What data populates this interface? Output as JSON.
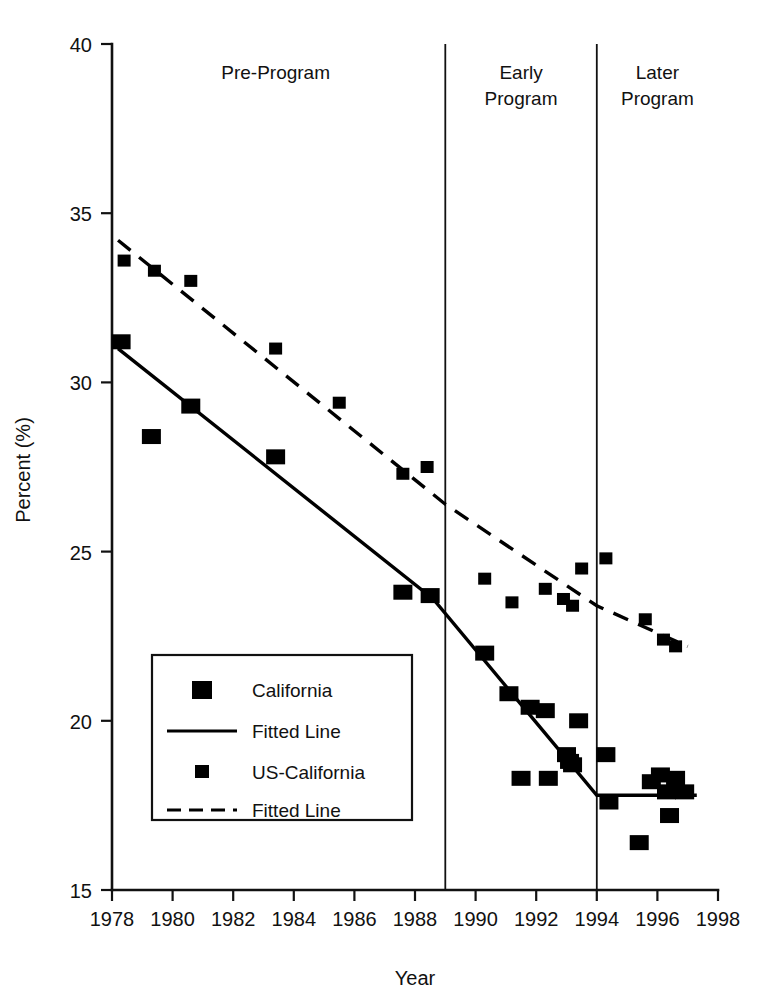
{
  "chart_data": {
    "type": "scatter",
    "title": "",
    "xlabel": "Year",
    "ylabel": "Percent (%)",
    "xlim": [
      1978,
      1998
    ],
    "ylim": [
      15,
      40
    ],
    "xticks": [
      1978,
      1980,
      1982,
      1984,
      1986,
      1988,
      1990,
      1992,
      1994,
      1996,
      1998
    ],
    "yticks": [
      15,
      20,
      25,
      30,
      35,
      40
    ],
    "grid": false,
    "legend_position": "inner-left-lower",
    "annotations": [
      {
        "text": "Pre-Program",
        "x": 1983.4,
        "y": 39.2
      },
      {
        "text": "Early\nProgram",
        "x": 1991.5,
        "y": 39.2
      },
      {
        "text": "Later\nProgram",
        "x": 1996.0,
        "y": 39.2
      }
    ],
    "vertical_dividers": [
      1989.0,
      1994.0
    ],
    "series": [
      {
        "name": "California",
        "marker": "square-large",
        "points": [
          {
            "x": 1978.3,
            "y": 31.2
          },
          {
            "x": 1979.3,
            "y": 28.4
          },
          {
            "x": 1980.6,
            "y": 29.3
          },
          {
            "x": 1983.4,
            "y": 27.8
          },
          {
            "x": 1987.6,
            "y": 23.8
          },
          {
            "x": 1988.5,
            "y": 23.7
          },
          {
            "x": 1990.3,
            "y": 22.0
          },
          {
            "x": 1991.1,
            "y": 20.8
          },
          {
            "x": 1991.5,
            "y": 18.3
          },
          {
            "x": 1991.8,
            "y": 20.4
          },
          {
            "x": 1992.3,
            "y": 20.3
          },
          {
            "x": 1992.4,
            "y": 18.3
          },
          {
            "x": 1993.0,
            "y": 19.0
          },
          {
            "x": 1993.1,
            "y": 18.8
          },
          {
            "x": 1993.2,
            "y": 18.7
          },
          {
            "x": 1993.4,
            "y": 20.0
          },
          {
            "x": 1994.3,
            "y": 19.0
          },
          {
            "x": 1994.4,
            "y": 17.6
          },
          {
            "x": 1995.4,
            "y": 16.4
          },
          {
            "x": 1995.8,
            "y": 18.2
          },
          {
            "x": 1996.1,
            "y": 18.4
          },
          {
            "x": 1996.3,
            "y": 17.9
          },
          {
            "x": 1996.4,
            "y": 17.2
          },
          {
            "x": 1996.6,
            "y": 18.3
          },
          {
            "x": 1996.9,
            "y": 17.9
          }
        ]
      },
      {
        "name": "US-California",
        "marker": "square-small",
        "points": [
          {
            "x": 1978.4,
            "y": 33.6
          },
          {
            "x": 1979.4,
            "y": 33.3
          },
          {
            "x": 1980.6,
            "y": 33.0
          },
          {
            "x": 1983.4,
            "y": 31.0
          },
          {
            "x": 1985.5,
            "y": 29.4
          },
          {
            "x": 1987.6,
            "y": 27.3
          },
          {
            "x": 1988.4,
            "y": 27.5
          },
          {
            "x": 1990.3,
            "y": 24.2
          },
          {
            "x": 1991.2,
            "y": 23.5
          },
          {
            "x": 1992.3,
            "y": 23.9
          },
          {
            "x": 1992.9,
            "y": 23.6
          },
          {
            "x": 1993.2,
            "y": 23.4
          },
          {
            "x": 1993.5,
            "y": 24.5
          },
          {
            "x": 1994.3,
            "y": 24.8
          },
          {
            "x": 1995.6,
            "y": 23.0
          },
          {
            "x": 1996.2,
            "y": 22.4
          },
          {
            "x": 1996.6,
            "y": 22.2
          }
        ]
      }
    ],
    "fits": [
      {
        "name": "California Fitted Line",
        "style": "solid",
        "vertices": [
          {
            "x": 1978.2,
            "y": 31.0
          },
          {
            "x": 1988.6,
            "y": 23.6
          },
          {
            "x": 1994.0,
            "y": 17.8
          },
          {
            "x": 1997.3,
            "y": 17.8
          }
        ]
      },
      {
        "name": "US-California Fitted Line",
        "style": "dashed",
        "vertices": [
          {
            "x": 1978.2,
            "y": 34.2
          },
          {
            "x": 1989.0,
            "y": 26.4
          },
          {
            "x": 1994.0,
            "y": 23.4
          },
          {
            "x": 1997.0,
            "y": 22.2
          }
        ]
      }
    ]
  },
  "axes": {
    "y_title": "Percent (%)",
    "x_title": "Year",
    "x_tick_labels": [
      "1978",
      "1980",
      "1982",
      "1984",
      "1986",
      "1988",
      "1990",
      "1992",
      "1994",
      "1996",
      "1998"
    ],
    "y_tick_labels": [
      "40",
      "35",
      "30",
      "25",
      "20",
      "15"
    ]
  },
  "regions": [
    {
      "id": "pre-program",
      "label": "Pre-Program",
      "lines": [
        "Pre-Program"
      ]
    },
    {
      "id": "early-program",
      "label": "Early Program",
      "lines": [
        "Early",
        "Program"
      ]
    },
    {
      "id": "later-program",
      "label": "Later Program",
      "lines": [
        "Later",
        "Program"
      ]
    }
  ],
  "legend": {
    "entries": [
      {
        "id": "california",
        "label": "California",
        "symbol": "square-large"
      },
      {
        "id": "california-fit",
        "label": "Fitted Line",
        "symbol": "line-solid"
      },
      {
        "id": "us-california",
        "label": "US-California",
        "symbol": "square-small"
      },
      {
        "id": "us-california-fit",
        "label": "Fitted Line",
        "symbol": "line-dashed"
      }
    ]
  },
  "colors": {
    "ink": "#000000",
    "background": "#ffffff"
  }
}
